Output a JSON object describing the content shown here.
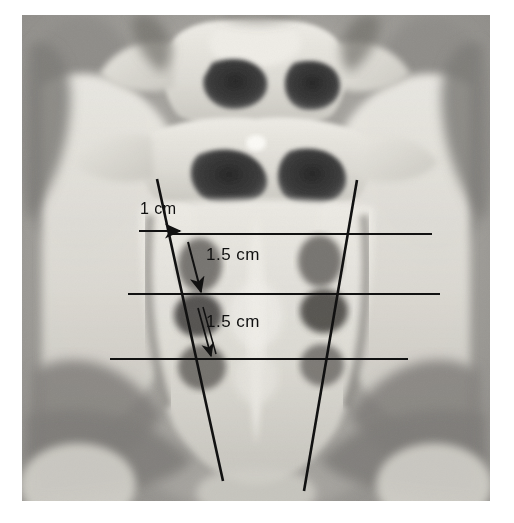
{
  "image": {
    "kind": "radiograph",
    "modality_description": "Grayscale anteroposterior radiograph / CT scanogram of the lumbosacral spine and pelvis",
    "frame": {
      "x": 22,
      "y": 15,
      "width": 468,
      "height": 486
    },
    "background_color": "#ffffff",
    "film_base_color": "#9a9a9a",
    "bone_color": "#e2e0da",
    "foramen_color": "#2f2f2f",
    "soft_tissue_color": "#8a8a8a"
  },
  "annotations": {
    "line_color": "#111111",
    "measurements": [
      {
        "id": "m1",
        "label": "1 cm",
        "orientation": "horizontal",
        "arrow": "right"
      },
      {
        "id": "m2",
        "label": "1.5 cm",
        "orientation": "vertical",
        "arrow": "down"
      },
      {
        "id": "m3",
        "label": "1.5 cm",
        "orientation": "vertical",
        "arrow": "down"
      }
    ],
    "reference_lines": {
      "horizontal_count": 3,
      "horizontal_y": [
        234,
        294,
        359
      ],
      "diagonal_count": 2,
      "diagonal_left": {
        "x1": 157,
        "y1": 179,
        "x2": 223,
        "y2": 481
      },
      "diagonal_right": {
        "x1": 357,
        "y1": 180,
        "x2": 304,
        "y2": 491
      }
    }
  },
  "anatomy": {
    "structures": [
      "L4 vertebral body",
      "L5 vertebral body",
      "sacral ala",
      "S1 sacral foramen",
      "S2 sacral foramen",
      "S3 sacral foramen",
      "right iliac wing",
      "left iliac wing",
      "sacroiliac joint",
      "femoral head"
    ]
  }
}
